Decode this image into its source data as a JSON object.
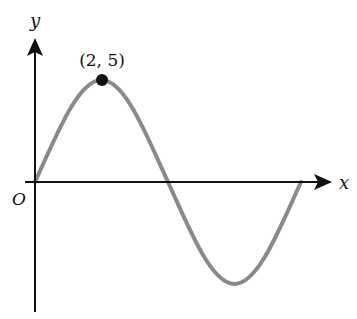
{
  "diagram": {
    "type": "sine-curve-graph",
    "axes": {
      "x_label": "x",
      "y_label": "y",
      "origin_label": "O"
    },
    "point": {
      "label": "(2, 5)",
      "x": 2,
      "y": 5
    },
    "curve": {
      "description": "one full period of a sine wave starting at origin",
      "color": "#8a8a8a",
      "zero_crossings": [
        0,
        4,
        8
      ],
      "maximum": [
        2,
        5
      ],
      "minimum": [
        6,
        -5
      ]
    }
  }
}
